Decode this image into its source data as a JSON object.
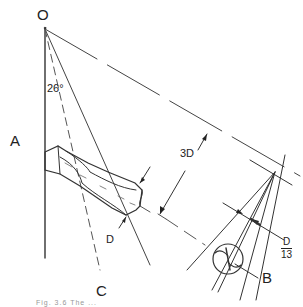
{
  "diagram": {
    "labels": {
      "origin": "O",
      "angle": "26°",
      "axis_a": "A",
      "axis_b": "B",
      "axis_c": "C",
      "diameter": "D",
      "offset": "3D",
      "fraction_numerator": "D",
      "fraction_denominator": "13"
    },
    "caption": "Fig. 3.6  The ...",
    "colors": {
      "line": "#333333",
      "construction": "#555555",
      "background": "#ffffff"
    }
  }
}
